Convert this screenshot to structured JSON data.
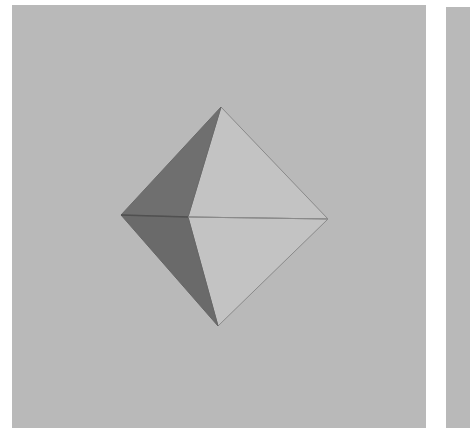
{
  "figure": {
    "panels": [
      {
        "id": "left",
        "label": ""
      },
      {
        "id": "right",
        "label": ""
      }
    ],
    "colors": {
      "page_background": "#ffffff",
      "panel_background": "#b9b9b9",
      "light_face": "#c3c3c3",
      "dark_face": "#6f6f6f",
      "edge": "#8a8a8a",
      "dark_edge": "#505050"
    },
    "vertices": {
      "top": [
        221,
        107
      ],
      "left": [
        121,
        215
      ],
      "right": [
        328,
        219
      ],
      "bottom": [
        218,
        326
      ],
      "front": [
        188,
        217
      ]
    }
  }
}
